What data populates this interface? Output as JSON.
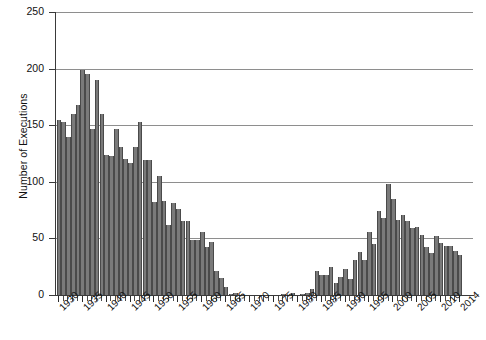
{
  "chart_data": {
    "type": "bar",
    "title": "",
    "xlabel": "",
    "ylabel": "Number of Executions",
    "ylim": [
      0,
      250
    ],
    "yticks": [
      0,
      50,
      100,
      150,
      200,
      250
    ],
    "grid": "horizontal",
    "legend": "none",
    "bar_color": "#7a7a7a",
    "bar_edge_color": "#4a4a4a",
    "xtick_labels": [
      "1930",
      "1935",
      "1940",
      "1945",
      "1950",
      "1955",
      "1960",
      "1965",
      "1970",
      "1975",
      "1980",
      "1985",
      "1990",
      "1995",
      "2000",
      "2005",
      "2010",
      "2014"
    ],
    "categories": [
      1930,
      1931,
      1932,
      1933,
      1934,
      1935,
      1936,
      1937,
      1938,
      1939,
      1940,
      1941,
      1942,
      1943,
      1944,
      1945,
      1946,
      1947,
      1948,
      1949,
      1950,
      1951,
      1952,
      1953,
      1954,
      1955,
      1956,
      1957,
      1958,
      1959,
      1960,
      1961,
      1962,
      1963,
      1964,
      1965,
      1966,
      1967,
      1968,
      1969,
      1970,
      1971,
      1972,
      1973,
      1974,
      1975,
      1976,
      1977,
      1978,
      1979,
      1980,
      1981,
      1982,
      1983,
      1984,
      1985,
      1986,
      1987,
      1988,
      1989,
      1990,
      1991,
      1992,
      1993,
      1994,
      1995,
      1996,
      1997,
      1998,
      1999,
      2000,
      2001,
      2002,
      2003,
      2004,
      2005,
      2006,
      2007,
      2008,
      2009,
      2010,
      2011,
      2012,
      2013,
      2014
    ],
    "values": [
      155,
      153,
      140,
      160,
      168,
      199,
      195,
      147,
      190,
      160,
      124,
      123,
      147,
      131,
      120,
      117,
      131,
      153,
      119,
      119,
      82,
      105,
      83,
      62,
      81,
      76,
      65,
      65,
      49,
      49,
      56,
      42,
      47,
      21,
      15,
      7,
      1,
      2,
      0,
      0,
      0,
      0,
      0,
      0,
      0,
      0,
      0,
      1,
      0,
      2,
      0,
      1,
      2,
      5,
      21,
      18,
      18,
      25,
      11,
      16,
      23,
      14,
      31,
      38,
      31,
      56,
      45,
      74,
      68,
      98,
      85,
      66,
      71,
      65,
      59,
      60,
      53,
      42,
      37,
      52,
      46,
      43,
      43,
      39,
      35
    ]
  },
  "axis": {
    "y_title": "Number of Executions"
  }
}
